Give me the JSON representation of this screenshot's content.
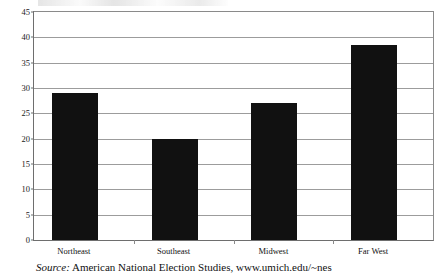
{
  "chart_data": {
    "type": "bar",
    "title": "",
    "subtitle": "",
    "xlabel": "",
    "ylabel": "",
    "categories": [
      "Northeast",
      "Southeast",
      "Midwest",
      "Far West"
    ],
    "values": [
      29,
      20,
      27,
      38.5
    ],
    "ylim": [
      0,
      45
    ],
    "yticks": [
      0,
      5,
      10,
      15,
      20,
      25,
      30,
      35,
      40,
      45
    ],
    "ytick_labels": [
      "0",
      "5",
      "10",
      "15",
      "20",
      "25",
      "30",
      "35",
      "40",
      "45"
    ],
    "grid": true,
    "legend": null,
    "bar_color": "#111111",
    "gridline_color": "#9c9c9c",
    "axis_color": "#6e6e6e",
    "background_color": "#ffffff"
  },
  "source": {
    "label": "Source:",
    "text": "American National Election Studies, www.umich.edu/~nes"
  }
}
